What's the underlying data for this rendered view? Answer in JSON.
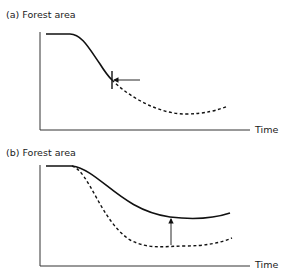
{
  "panels": [
    {
      "id": "a",
      "title": "(a) Forest area",
      "xlabel": "Time",
      "curves": [
        {
          "name": "actual-trajectory",
          "style": "solid"
        },
        {
          "name": "projected-trajectory",
          "style": "dashed"
        }
      ],
      "annotation": "horizontal arrow pointing to intervention point marked by vertical tick"
    },
    {
      "id": "b",
      "title": "(b) Forest area",
      "xlabel": "Time",
      "curves": [
        {
          "name": "actual-trajectory",
          "style": "solid"
        },
        {
          "name": "counterfactual-trajectory",
          "style": "dashed"
        }
      ],
      "annotation": "vertical arrow from dashed curve up to solid curve"
    }
  ],
  "colors": {
    "line": "#111111",
    "axis": "#333333"
  }
}
